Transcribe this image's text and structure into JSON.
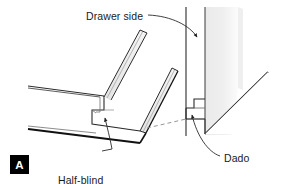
{
  "figure": {
    "panel_letter": "A",
    "title_alt": "Half-blind rabbet and dado drawer joint",
    "labels": {
      "drawer_side": "Drawer side",
      "dado": "Dado",
      "half_blind_line1": "Half-blind",
      "half_blind_line2": "rabbet"
    },
    "colors": {
      "background": "#ffffff",
      "line": "#2b2b2b",
      "heavy_line": "#111111",
      "light_line": "#6f6f6f",
      "shading": "#e2e2e2",
      "dashed_line": "#8a8a8a",
      "badge_bg": "#000000",
      "badge_text": "#ffffff",
      "text": "#1a1a1a"
    }
  }
}
